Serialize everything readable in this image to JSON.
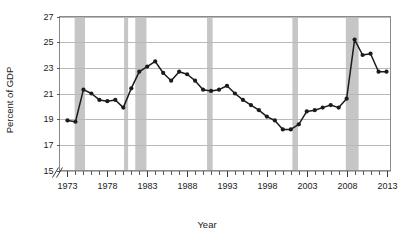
{
  "chart_data": {
    "type": "line",
    "title": "",
    "xlabel": "Year",
    "ylabel": "Percent of GDP",
    "xlim": [
      1972,
      2013.5
    ],
    "ylim": [
      15,
      27
    ],
    "yticks": [
      15,
      17,
      19,
      21,
      23,
      25,
      27
    ],
    "xticks_labeled": [
      1973,
      1978,
      1983,
      1988,
      1993,
      1998,
      2003,
      2008,
      2013
    ],
    "xtick_step_minor": 1,
    "grid": "horizontal",
    "legend": "none",
    "axis_break_y": true,
    "marker": "filled-circle",
    "x": [
      1973,
      1974,
      1975,
      1976,
      1977,
      1978,
      1979,
      1980,
      1981,
      1982,
      1983,
      1984,
      1985,
      1986,
      1987,
      1988,
      1989,
      1990,
      1991,
      1992,
      1993,
      1994,
      1995,
      1996,
      1997,
      1998,
      1999,
      2000,
      2001,
      2002,
      2003,
      2004,
      2005,
      2006,
      2007,
      2008,
      2009,
      2010,
      2011,
      2012,
      2013
    ],
    "values": [
      18.9,
      18.8,
      21.3,
      21.0,
      20.5,
      20.4,
      20.5,
      19.9,
      21.4,
      22.7,
      23.1,
      23.5,
      22.6,
      22.0,
      22.7,
      22.5,
      22.0,
      21.3,
      21.2,
      21.3,
      21.6,
      21.0,
      20.5,
      20.1,
      19.7,
      19.2,
      18.9,
      18.2,
      18.2,
      18.6,
      19.6,
      19.7,
      19.9,
      20.1,
      19.9,
      20.6,
      25.2,
      24.0,
      24.1,
      22.7,
      22.7
    ],
    "recession_bands": [
      {
        "start": 1973.9,
        "end": 1975.2
      },
      {
        "start": 1980.1,
        "end": 1980.6
      },
      {
        "start": 1981.5,
        "end": 1982.9
      },
      {
        "start": 1990.5,
        "end": 1991.2
      },
      {
        "start": 2001.2,
        "end": 2001.9
      },
      {
        "start": 2007.9,
        "end": 2009.5
      }
    ]
  }
}
